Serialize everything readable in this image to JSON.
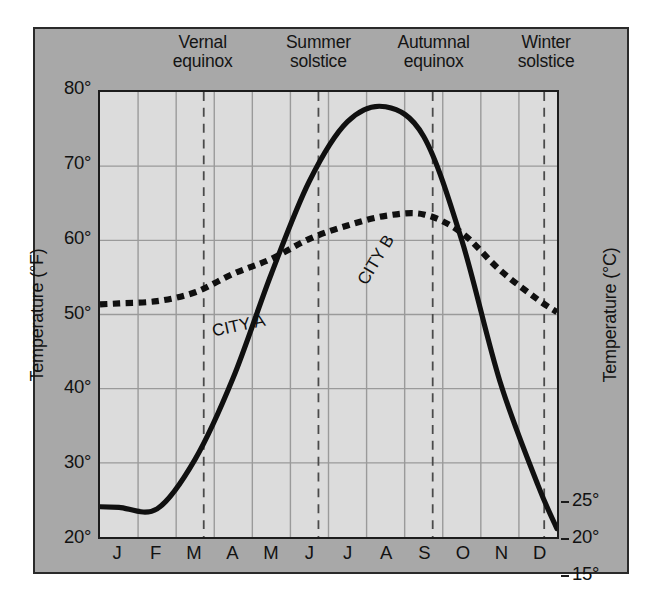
{
  "chart_data": {
    "type": "line",
    "title": "",
    "xlabel": "",
    "ylabel": "Temperature (°F)",
    "ylabel_right": "Temperature (°C)",
    "grid": true,
    "legend": "inline-curve-labels",
    "categories": [
      "J",
      "F",
      "M",
      "A",
      "M",
      "J",
      "J",
      "A",
      "S",
      "O",
      "N",
      "D"
    ],
    "ylim_f": [
      20,
      80
    ],
    "ylim_c": [
      -6.7,
      26.7
    ],
    "yticks_f": [
      "20°",
      "30°",
      "40°",
      "50°",
      "60°",
      "70°",
      "80°"
    ],
    "yticks_f_values": [
      20,
      30,
      40,
      50,
      60,
      70,
      80
    ],
    "yticks_c": [
      "−5°",
      "0°",
      "5°",
      "10°",
      "15°",
      "20°",
      "25°"
    ],
    "yticks_c_values": [
      -5,
      0,
      5,
      10,
      15,
      20,
      25
    ],
    "series": [
      {
        "name": "CITY A",
        "style": "dotted",
        "values": [
          51.5,
          51.8,
          53.0,
          55.5,
          57.5,
          60.2,
          62.0,
          63.3,
          63.5,
          61.0,
          56.0,
          52.0
        ]
      },
      {
        "name": "CITY B",
        "style": "solid",
        "values": [
          24.0,
          23.8,
          30.5,
          41.5,
          55.5,
          68.0,
          76.0,
          78.0,
          74.0,
          60.0,
          41.0,
          27.0
        ]
      }
    ],
    "annotations": [
      {
        "id": "vernal-equinox",
        "label_line1": "Vernal",
        "label_line2": "equinox",
        "x_month": "M",
        "x_frac": 0.227
      },
      {
        "id": "summer-solstice",
        "label_line1": "Summer",
        "label_line2": "solstice",
        "x_month": "J",
        "x_frac": 0.478
      },
      {
        "id": "autumnal-equinox",
        "label_line1": "Autumnal",
        "label_line2": "equinox",
        "x_month": "S",
        "x_frac": 0.728
      },
      {
        "id": "winter-solstice",
        "label_line1": "Winter",
        "label_line2": "solstice",
        "x_month": "D",
        "x_frac": 0.972
      }
    ],
    "colors": {
      "figure_background": "#a8a8a8",
      "plot_background": "#dcdcdc",
      "grid": "#9a9a9a",
      "curve": "#101010",
      "annotation_line": "#4a4a4a",
      "text": "#121212"
    }
  }
}
